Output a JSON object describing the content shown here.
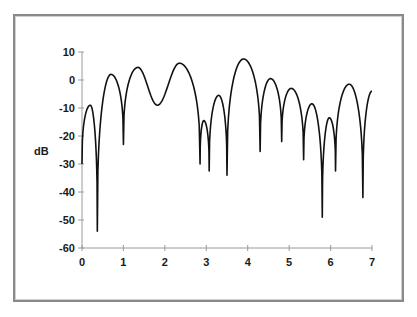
{
  "chart_data": {
    "type": "line",
    "title": "",
    "xlabel": "",
    "ylabel": "dB",
    "xlim": [
      0,
      7
    ],
    "ylim": [
      -60,
      10
    ],
    "x_ticks": [
      0,
      1,
      2,
      3,
      4,
      5,
      6,
      7
    ],
    "y_ticks": [
      10,
      0,
      -10,
      -20,
      -30,
      -40,
      -50,
      -60
    ],
    "grid": false,
    "legend": null,
    "series": [
      {
        "name": "dB",
        "color": "#111111",
        "key_points": [
          {
            "x": 0.0,
            "y": -30,
            "kind": "start"
          },
          {
            "x": 0.2,
            "y": -9,
            "kind": "peak"
          },
          {
            "x": 0.37,
            "y": -54,
            "kind": "null"
          },
          {
            "x": 0.7,
            "y": 2,
            "kind": "peak"
          },
          {
            "x": 1.0,
            "y": -23,
            "kind": "null"
          },
          {
            "x": 1.35,
            "y": 4.5,
            "kind": "peak"
          },
          {
            "x": 1.82,
            "y": -9,
            "kind": "min"
          },
          {
            "x": 2.35,
            "y": 6,
            "kind": "peak"
          },
          {
            "x": 2.85,
            "y": -30,
            "kind": "null"
          },
          {
            "x": 2.94,
            "y": -14.5,
            "kind": "peak"
          },
          {
            "x": 3.07,
            "y": -32.5,
            "kind": "null"
          },
          {
            "x": 3.3,
            "y": -5.5,
            "kind": "peak"
          },
          {
            "x": 3.5,
            "y": -34,
            "kind": "null"
          },
          {
            "x": 3.9,
            "y": 7.5,
            "kind": "peak"
          },
          {
            "x": 4.3,
            "y": -25.5,
            "kind": "null"
          },
          {
            "x": 4.55,
            "y": 0.5,
            "kind": "peak"
          },
          {
            "x": 4.82,
            "y": -22,
            "kind": "null"
          },
          {
            "x": 5.05,
            "y": -3,
            "kind": "peak"
          },
          {
            "x": 5.35,
            "y": -28.5,
            "kind": "null"
          },
          {
            "x": 5.55,
            "y": -8.5,
            "kind": "peak"
          },
          {
            "x": 5.8,
            "y": -49,
            "kind": "null"
          },
          {
            "x": 5.97,
            "y": -13.5,
            "kind": "peak"
          },
          {
            "x": 6.12,
            "y": -32.5,
            "kind": "null"
          },
          {
            "x": 6.45,
            "y": -1.5,
            "kind": "peak"
          },
          {
            "x": 6.78,
            "y": -42,
            "kind": "null"
          },
          {
            "x": 7.0,
            "y": -4,
            "kind": "end"
          }
        ]
      }
    ]
  },
  "axis": {
    "y_labels": [
      "10",
      "0",
      "-10",
      "-20",
      "-30",
      "-40",
      "-50",
      "-60"
    ],
    "x_labels": [
      "0",
      "1",
      "2",
      "3",
      "4",
      "5",
      "6",
      "7"
    ],
    "ylabel": "dB"
  }
}
